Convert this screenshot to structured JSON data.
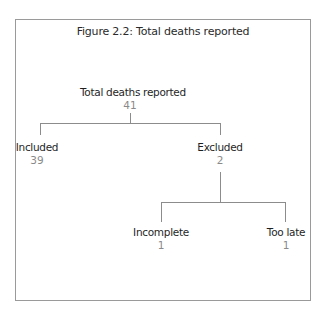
{
  "figure": {
    "title": "Figure 2.2: Total deaths reported"
  },
  "tree": {
    "root": {
      "label": "Total deaths reported",
      "value": "41"
    },
    "included": {
      "label": "Included",
      "value": "39"
    },
    "excluded": {
      "label": "Excluded",
      "value": "2"
    },
    "incomplete": {
      "label": "Incomplete",
      "value": "1"
    },
    "too_late": {
      "label": "Too late",
      "value": "1"
    }
  },
  "colors": {
    "label": "#1f1f1f",
    "value": "#8a8a8a",
    "line": "#8c8c8c",
    "border": "#9a9a9a"
  }
}
